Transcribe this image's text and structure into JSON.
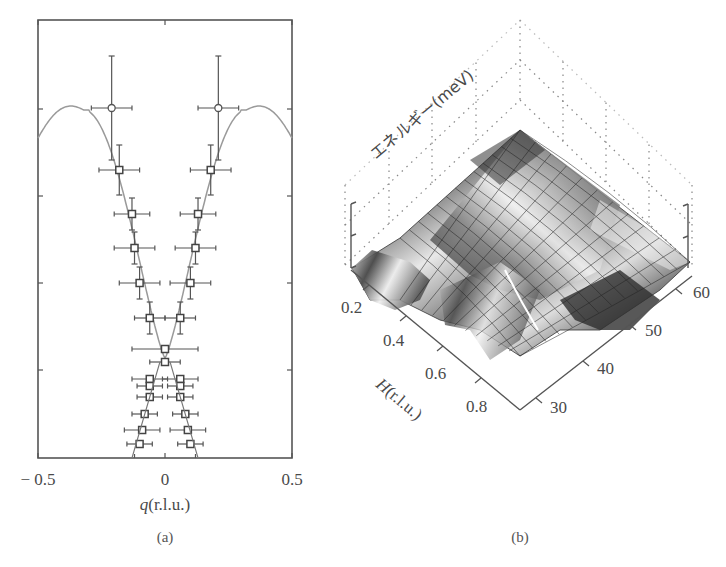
{
  "chart_data": [
    {
      "panel": "a",
      "type": "scatter",
      "caption": "(a)",
      "xlabel_italic": "q",
      "xlabel_rest": "(r.l.u.)",
      "ylabel": "",
      "xlim": [
        -0.5,
        0.5
      ],
      "x_ticks": [
        -0.5,
        0,
        0.5
      ],
      "x_tick_labels": [
        "− 0.5",
        "0",
        "0.5"
      ],
      "y_ticks_unlabeled": 4,
      "grid": false,
      "series": [
        {
          "name": "data (left branch)",
          "marker": "open-square/diamond with error bars",
          "points": [
            {
              "x": -0.21,
              "y_px": 108,
              "xerr": 0.08,
              "yerr_px": 52
            },
            {
              "x": -0.18,
              "y_px": 170,
              "xerr": 0.08,
              "yerr_px": 25
            },
            {
              "x": -0.13,
              "y_px": 214,
              "xerr": 0.07,
              "yerr_px": 16
            },
            {
              "x": -0.12,
              "y_px": 248,
              "xerr": 0.08,
              "yerr_px": 16
            },
            {
              "x": -0.1,
              "y_px": 283,
              "xerr": 0.08,
              "yerr_px": 16
            },
            {
              "x": -0.06,
              "y_px": 318,
              "xerr": 0.06,
              "yerr_px": 16
            }
          ]
        },
        {
          "name": "data (right branch)",
          "marker": "open-square/diamond with error bars",
          "points": [
            {
              "x": 0.21,
              "y_px": 108,
              "xerr": 0.08,
              "yerr_px": 52
            },
            {
              "x": 0.18,
              "y_px": 170,
              "xerr": 0.08,
              "yerr_px": 25
            },
            {
              "x": 0.13,
              "y_px": 214,
              "xerr": 0.07,
              "yerr_px": 16
            },
            {
              "x": 0.12,
              "y_px": 248,
              "xerr": 0.08,
              "yerr_px": 16
            },
            {
              "x": 0.1,
              "y_px": 283,
              "xerr": 0.08,
              "yerr_px": 16
            },
            {
              "x": 0.06,
              "y_px": 318,
              "xerr": 0.06,
              "yerr_px": 16
            }
          ]
        },
        {
          "name": "data (center)",
          "points": [
            {
              "x": 0.0,
              "y_px": 349,
              "xerr": 0.13
            },
            {
              "x": 0.0,
              "y_px": 362,
              "xerr": 0.06
            }
          ]
        },
        {
          "name": "data (lower pairs)",
          "points": [
            {
              "x": -0.06,
              "y_px": 379,
              "xerr": 0.07
            },
            {
              "x": 0.06,
              "y_px": 379,
              "xerr": 0.07
            },
            {
              "x": -0.06,
              "y_px": 386,
              "xerr": 0.05
            },
            {
              "x": 0.06,
              "y_px": 386,
              "xerr": 0.05
            },
            {
              "x": -0.06,
              "y_px": 397,
              "xerr": 0.05
            },
            {
              "x": 0.06,
              "y_px": 397,
              "xerr": 0.05
            },
            {
              "x": -0.08,
              "y_px": 414,
              "xerr": 0.05
            },
            {
              "x": 0.08,
              "y_px": 414,
              "xerr": 0.05
            },
            {
              "x": -0.09,
              "y_px": 430,
              "xerr": 0.07
            },
            {
              "x": 0.09,
              "y_px": 430,
              "xerr": 0.07
            },
            {
              "x": -0.1,
              "y_px": 444,
              "xerr": 0.05
            },
            {
              "x": 0.1,
              "y_px": 444,
              "xerr": 0.05
            }
          ]
        },
        {
          "name": "dispersion curve (fit)",
          "type": "line",
          "color": "#9a9a9a",
          "description": "V-shaped dispersion from q=0 rising to maxima near q=±0.33 then dropping to edges"
        }
      ]
    },
    {
      "panel": "b",
      "type": "surface3d",
      "caption": "(b)",
      "zlabel": "エネルギー(meV)",
      "xlabel_italic": "H",
      "xlabel_rest": "(r.l.u.)",
      "x_ticks": [
        0.2,
        0.4,
        0.6,
        0.8
      ],
      "x_tick_labels": [
        "0.2",
        "0.4",
        "0.6",
        "0.8"
      ],
      "y_ticks": [
        30,
        40,
        50,
        60
      ],
      "y_tick_labels": [
        "30",
        "40",
        "50",
        "60"
      ],
      "grid": "dotted box",
      "colormap": "grayscale"
    }
  ]
}
